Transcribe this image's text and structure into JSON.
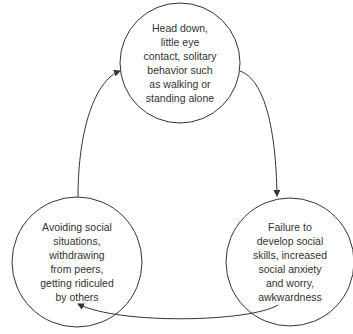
{
  "diagram": {
    "type": "cycle",
    "stroke_color": "#333333",
    "nodes": [
      {
        "id": "top",
        "text": "Head down,\nlittle eye\ncontact, solitary\nbehavior such\nas walking or\nstanding alone"
      },
      {
        "id": "right",
        "text": "Failure to\ndevelop social\nskills, increased\nsocial anxiety\nand worry,\nawkwardness"
      },
      {
        "id": "left",
        "text": "Avoiding social\nsituations,\nwithdrawing\nfrom peers,\ngetting ridiculed\nby others"
      }
    ],
    "edges": [
      {
        "from": "top",
        "to": "right"
      },
      {
        "from": "right",
        "to": "left"
      },
      {
        "from": "left",
        "to": "top"
      }
    ]
  }
}
